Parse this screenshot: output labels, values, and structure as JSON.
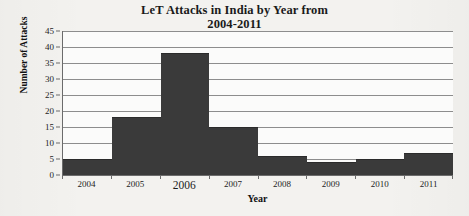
{
  "chart_data": {
    "type": "bar",
    "title": "LeT Attacks in India by Year from 2004-2011",
    "title_line1": "LeT Attacks in India by Year from",
    "title_line2": "2004-2011",
    "categories": [
      "2004",
      "2005",
      "2006",
      "2007",
      "2008",
      "2009",
      "2010",
      "2011"
    ],
    "values": [
      5,
      18,
      38,
      15,
      6,
      4,
      5,
      7
    ],
    "xlabel": "Year",
    "ylabel": "Number of Attacks",
    "ylim": [
      0,
      45
    ],
    "ytick_step": 5,
    "yticks": [
      0,
      5,
      10,
      15,
      20,
      25,
      30,
      35,
      40,
      45
    ],
    "ytick_labels": [
      "0",
      "5",
      "10",
      "15",
      "20",
      "25",
      "30",
      "35",
      "40",
      "45"
    ],
    "grid": true,
    "grid_axis": "y",
    "legend": false,
    "bar_gap": 0,
    "bar_color": "#3a3a3a",
    "plot_background": "#fbfbfa",
    "page_background": "#f3f2ef",
    "axis_color": "#6b6b6b",
    "gridline_color": "#8d8d8d",
    "emphasized_category": "2006"
  }
}
